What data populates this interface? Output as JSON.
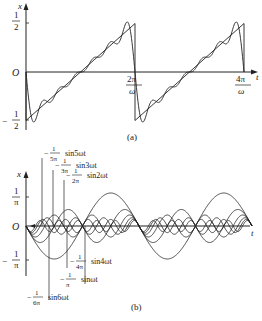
{
  "figure": {
    "panel_a": {
      "caption": "(a)",
      "x_axis_label": "t",
      "y_axis_label": "x",
      "origin_label": "O",
      "y_ticks": [
        {
          "num": "1",
          "den": "2",
          "sign": "",
          "value": 0.5
        },
        {
          "num": "1",
          "den": "2",
          "sign": "−",
          "value": -0.5
        }
      ],
      "x_ticks": [
        {
          "num": "2π",
          "den": "ω",
          "value": "2pi/omega"
        },
        {
          "num": "4π",
          "den": "ω",
          "value": "4pi/omega"
        }
      ],
      "description": "Sawtooth wave x(t) ranging from -1/2 to 1/2 with Fourier partial sum approximation (Gibbs overshoot)"
    },
    "panel_b": {
      "caption": "(b)",
      "x_axis_label": "t",
      "y_axis_label": "x",
      "origin_label": "O",
      "y_ticks": [
        {
          "num": "1",
          "den": "π",
          "sign": "",
          "value": 0.3183
        },
        {
          "num": "1",
          "den": "π",
          "sign": "−",
          "value": -0.3183
        }
      ],
      "harmonic_labels": [
        {
          "sign": "−",
          "num": "1",
          "den": "5π",
          "term": "sin5ωt"
        },
        {
          "sign": "−",
          "num": "1",
          "den": "3π",
          "term": "sin3ωt"
        },
        {
          "sign": "−",
          "num": "1",
          "den": "2π",
          "term": "sin2ωt"
        },
        {
          "sign": "−",
          "num": "1",
          "den": "4π",
          "term": "sin4ωt"
        },
        {
          "sign": "−",
          "num": "1",
          "den": "π",
          "term": "sinωt"
        },
        {
          "sign": "−",
          "num": "1",
          "den": "6π",
          "term": "sin6ωt"
        }
      ],
      "description": "Fourier harmonic components -(1/nπ) sin(nωt), n=1..6"
    }
  }
}
